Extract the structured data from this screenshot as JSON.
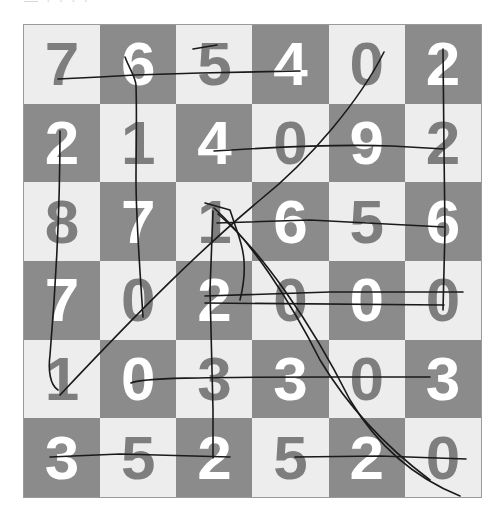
{
  "header": {
    "partial_text": "— · · · ·"
  },
  "colors": {
    "light_cell": "#ededed",
    "dark_cell": "#8b8b8b",
    "light_digit": "#7e7e7e",
    "dark_digit": "#ffffff",
    "pen": "#1a1a1a"
  },
  "grid": {
    "rows": 6,
    "cols": 6,
    "cells": [
      [
        {
          "d": "7",
          "shade": "light"
        },
        {
          "d": "6",
          "shade": "dark"
        },
        {
          "d": "5",
          "shade": "light"
        },
        {
          "d": "4",
          "shade": "dark"
        },
        {
          "d": "0",
          "shade": "light"
        },
        {
          "d": "2",
          "shade": "dark"
        }
      ],
      [
        {
          "d": "2",
          "shade": "dark"
        },
        {
          "d": "1",
          "shade": "light"
        },
        {
          "d": "4",
          "shade": "dark"
        },
        {
          "d": "0",
          "shade": "light"
        },
        {
          "d": "9",
          "shade": "dark"
        },
        {
          "d": "2",
          "shade": "light"
        }
      ],
      [
        {
          "d": "8",
          "shade": "light"
        },
        {
          "d": "7",
          "shade": "dark"
        },
        {
          "d": "1",
          "shade": "light"
        },
        {
          "d": "6",
          "shade": "dark"
        },
        {
          "d": "5",
          "shade": "light"
        },
        {
          "d": "6",
          "shade": "dark"
        }
      ],
      [
        {
          "d": "7",
          "shade": "dark"
        },
        {
          "d": "0",
          "shade": "light"
        },
        {
          "d": "2",
          "shade": "dark"
        },
        {
          "d": "0",
          "shade": "light"
        },
        {
          "d": "0",
          "shade": "dark"
        },
        {
          "d": "0",
          "shade": "light"
        }
      ],
      [
        {
          "d": "1",
          "shade": "light"
        },
        {
          "d": "0",
          "shade": "dark"
        },
        {
          "d": "3",
          "shade": "light"
        },
        {
          "d": "3",
          "shade": "dark"
        },
        {
          "d": "0",
          "shade": "light"
        },
        {
          "d": "3",
          "shade": "dark"
        }
      ],
      [
        {
          "d": "3",
          "shade": "dark"
        },
        {
          "d": "5",
          "shade": "light"
        },
        {
          "d": "2",
          "shade": "dark"
        },
        {
          "d": "5",
          "shade": "light"
        },
        {
          "d": "2",
          "shade": "dark"
        },
        {
          "d": "0",
          "shade": "light"
        }
      ]
    ]
  },
  "pen_strokes": [
    "M58,79 L100,77 L135,75 L200,73 L300,71",
    "M125,57 C130,70 135,76 136,85 C137,120 136,150 136,180 C136,220 140,270 143,317",
    "M193,49 L217,45",
    "M60,131 C60,180 58,260 50,355 C48,370 50,385 58,390",
    "M214,151 C260,148 340,144 392,146 L444,149",
    "M443,49 L444,150 L445,230 L443,310",
    "M384,52 C360,100 310,160 260,200 C200,250 140,310 60,395",
    "M205,203 L230,210 L235,225 C240,240 250,260 240,300",
    "M214,208 C250,240 290,300 320,360 C350,410 390,450 430,480",
    "M218,214 C260,250 310,320 350,400 C380,450 420,480 460,496",
    "M213,211 L210,290 L213,410 L213,458",
    "M217,223 L310,220 L444,227",
    "M205,296 L330,292 L463,292",
    "M205,303 L444,305",
    "M131,383 C140,378 200,377 330,377 L430,377",
    "M50,457 L120,454 L230,457",
    "M295,457 L380,456 L466,459"
  ]
}
